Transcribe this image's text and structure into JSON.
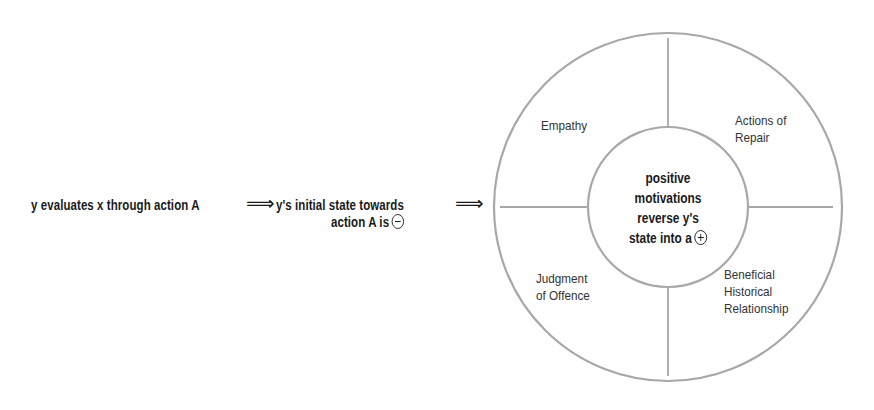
{
  "flow": {
    "step1": "y evaluates x through action A",
    "arrow1": "⟹",
    "step2_line1": "y's initial state towards",
    "step2_line2": "action A is",
    "step2_sign": "minus",
    "arrow2": "⟹"
  },
  "wheel": {
    "center": {
      "line1": "positive",
      "line2": "motivations",
      "line3": "reverse y's",
      "line4": "state into a",
      "sign": "plus"
    },
    "segments": [
      {
        "position": "top-left",
        "line1": "Empathy"
      },
      {
        "position": "top-right",
        "line1": "Actions of",
        "line2": "Repair"
      },
      {
        "position": "bottom-left",
        "line1": "Judgment",
        "line2": "of Offence"
      },
      {
        "position": "bottom-right",
        "line1": "Beneficial",
        "line2": "Historical",
        "line3": "Relationship"
      }
    ]
  },
  "colors": {
    "line": "#a8a8a8",
    "text": "#1a1a1a",
    "label": "#333333",
    "background": "#ffffff"
  }
}
